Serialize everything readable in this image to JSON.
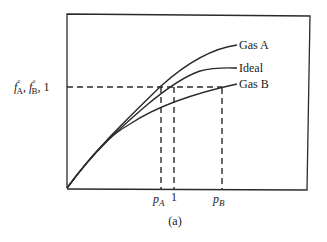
{
  "figure": {
    "caption": "(a)",
    "y_axis_label_parts": {
      "fA": "f",
      "fA_sup": "°",
      "fA_sub": "A",
      "sep1": ", ",
      "fB": "f",
      "fB_sup": "°",
      "fB_sub": "B",
      "sep2": ", 1"
    },
    "x_ticks": [
      {
        "base": "p",
        "sub": "A"
      },
      {
        "base": "1",
        "sub": ""
      },
      {
        "base": "p",
        "sub": "B"
      }
    ],
    "curves": [
      {
        "label": "Gas A",
        "position": "top"
      },
      {
        "label": "Ideal",
        "position": "middle"
      },
      {
        "label": "Gas B",
        "position": "bottom"
      }
    ],
    "colors": {
      "line": "#2a2a2a",
      "background": "#ffffff"
    }
  }
}
